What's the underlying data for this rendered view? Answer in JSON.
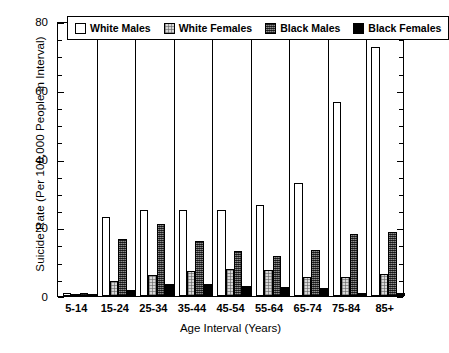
{
  "chart_data": {
    "type": "bar",
    "title": "",
    "xlabel": "Age Interval (Years)",
    "ylabel": "Suicide Rate (Per 100,000 People in Interval)",
    "categories": [
      "5-14",
      "15-24",
      "25-34",
      "35-44",
      "45-54",
      "55-64",
      "65-74",
      "75-84",
      "85+"
    ],
    "series": [
      {
        "name": "White Males",
        "values": [
          1.0,
          23.0,
          25.0,
          25.0,
          25.0,
          26.5,
          33.0,
          56.5,
          72.5
        ]
      },
      {
        "name": "White Females",
        "values": [
          0.3,
          4.3,
          6.0,
          7.3,
          8.0,
          7.5,
          5.5,
          5.5,
          6.5
        ]
      },
      {
        "name": "Black Males",
        "values": [
          1.0,
          16.5,
          21.0,
          16.0,
          13.0,
          11.5,
          13.5,
          18.0,
          18.5
        ]
      },
      {
        "name": "Black Females",
        "values": [
          0.2,
          1.8,
          3.5,
          3.5,
          3.0,
          2.5,
          2.3,
          1.0,
          1.0
        ]
      }
    ],
    "ylim": [
      0,
      80
    ],
    "yticks": [
      0,
      20,
      40,
      60,
      80
    ],
    "ytick_labels": [
      "0",
      "20",
      "40",
      "60",
      "80"
    ],
    "yminor_step": 5,
    "grid": false,
    "legend_position": "top-inside"
  },
  "legend": {
    "entries": [
      {
        "label": "White Males",
        "swatch": "open-white-square-icon"
      },
      {
        "label": "White Females",
        "swatch": "light-stipple-square-icon"
      },
      {
        "label": "Black Males",
        "swatch": "dark-checker-square-icon"
      },
      {
        "label": "Black Females",
        "swatch": "solid-black-square-icon"
      }
    ]
  }
}
